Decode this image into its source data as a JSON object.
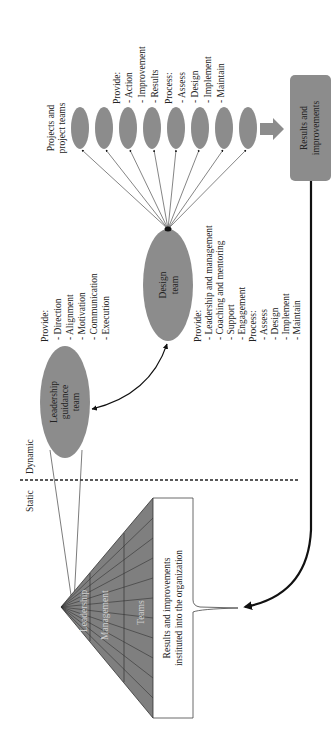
{
  "diagram": {
    "colors": {
      "shape_fill": "#8c8c8c",
      "pyramid_fill": "#7f7f7f",
      "line": "#222222",
      "background": "#ffffff"
    },
    "zones": {
      "static_label": "Static",
      "dynamic_label": "Dynamic"
    },
    "leadership": {
      "label_line1": "Leadership",
      "label_line2": "guidance",
      "label_line3": "team",
      "provide_heading": "Provide:",
      "provide_items": [
        "- Direction",
        "- Alignment",
        "- Motivation",
        "- Communication",
        "- Execution"
      ]
    },
    "design": {
      "label_line1": "Design",
      "label_line2": "team",
      "list": [
        "Provide:",
        "- Leadership and management",
        "- Coaching and mentoring",
        "- Support",
        "- Engagement",
        "Process:",
        "- Assess",
        "- Design",
        "- Implement",
        "- Maintain"
      ]
    },
    "projects": {
      "label_line1": "Projects and",
      "label_line2": "project teams",
      "count": 8,
      "list": [
        "Provide:",
        "- Action",
        "- Improvement",
        "- Results",
        "Process:",
        "- Assess",
        "- Design",
        "- Implement",
        "- Maintain"
      ]
    },
    "results": {
      "label_line1": "Results and",
      "label_line2": "improvements"
    },
    "pyramid": {
      "levels": [
        "Leadership",
        "Management",
        "Teams"
      ],
      "brace_line1": "Results and improvements",
      "brace_line2": "instituted into the organization"
    }
  }
}
